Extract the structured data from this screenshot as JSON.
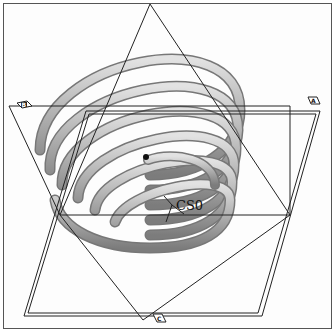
{
  "view": {
    "title": "Helical spring model with datum planes",
    "background": "#fdfdfd",
    "frame_color": "#555555"
  },
  "spring": {
    "tube_color": "#a8a8a8",
    "tube_highlight": "#d9d9d9",
    "tube_shadow": "#7a7a7a",
    "coil_count": 6
  },
  "datum_planes": [
    {
      "id": "plane-a",
      "label": "A"
    },
    {
      "id": "plane-b",
      "label": "B"
    },
    {
      "id": "plane-c",
      "label": "C"
    }
  ],
  "coordinate_system": {
    "label": "CS0"
  },
  "colors": {
    "line": "#222222",
    "tag_fill": "#ffffff"
  }
}
